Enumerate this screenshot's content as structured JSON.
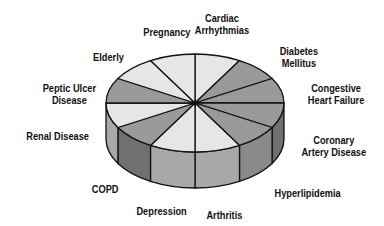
{
  "chart_data": {
    "type": "pie",
    "style": "3d-disc",
    "title": "",
    "categories": [
      "Cardiac Arrhythmias",
      "Diabetes Mellitus",
      "Congestive Heart Failure",
      "Coronary Artery Disease",
      "Hyperlipidemia",
      "Arthritis",
      "Depression",
      "COPD",
      "Renal Disease",
      "Peptic Ulcer Disease",
      "Elderly",
      "Pregnancy"
    ],
    "values": [
      1,
      1,
      1,
      1,
      1,
      1,
      1,
      1,
      1,
      1,
      1,
      1
    ],
    "fills": [
      "#e6e6e6",
      "#9a9a9a",
      "#9a9a9a",
      "#9a9a9a",
      "#9a9a9a",
      "#e6e6e6",
      "#e6e6e6",
      "#9a9a9a",
      "#e6e6e6",
      "#9a9a9a",
      "#e6e6e6",
      "#e6e6e6"
    ],
    "legend": "none"
  },
  "labels": [
    {
      "text": "Cardiac\nArrhythmias",
      "x": 222,
      "y": 12
    },
    {
      "text": "Diabetes\nMellitus",
      "x": 299,
      "y": 45
    },
    {
      "text": "Congestive\nHeart Failure",
      "x": 336,
      "y": 82
    },
    {
      "text": "Coronary\nArtery Disease",
      "x": 334,
      "y": 134
    },
    {
      "text": "Hyperlipidemia",
      "x": 307,
      "y": 187
    },
    {
      "text": "Arthritis",
      "x": 224,
      "y": 209
    },
    {
      "text": "Depression",
      "x": 161,
      "y": 205
    },
    {
      "text": "COPD",
      "x": 105,
      "y": 183
    },
    {
      "text": "Renal Disease",
      "x": 57,
      "y": 130
    },
    {
      "text": "Peptic Ulcer\nDisease",
      "x": 69,
      "y": 82
    },
    {
      "text": "Elderly",
      "x": 108,
      "y": 51
    },
    {
      "text": "Pregnancy",
      "x": 167,
      "y": 26
    }
  ],
  "colors": {
    "light": "#e6e6e6",
    "mid": "#9a9a9a",
    "side_light": "#a8a8a8",
    "side_mid": "#8a8a8a",
    "side_dark": "#707070",
    "outline": "#111111"
  }
}
